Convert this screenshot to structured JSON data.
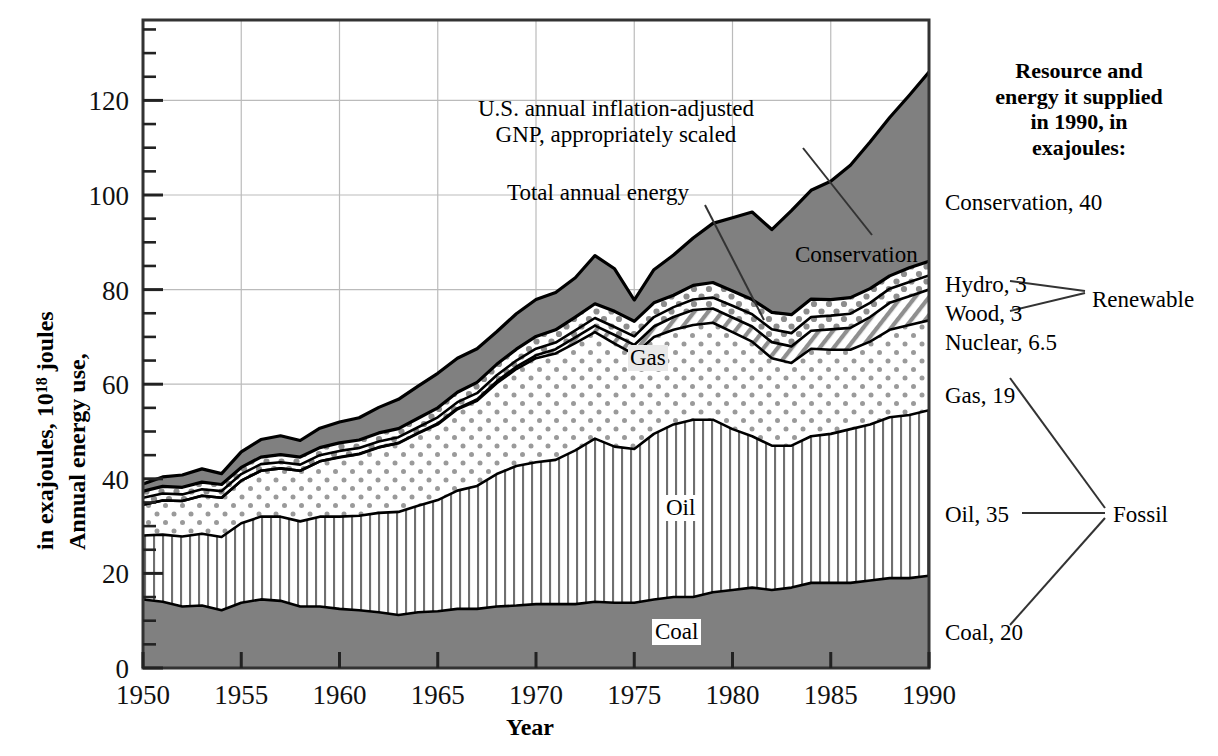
{
  "axes": {
    "x_title": "Year",
    "y_title_line1": "Annual energy use,",
    "y_title_line2_a": "in exajoules, 10",
    "y_title_line2_sup": "18",
    "y_title_line2_b": " joules",
    "x_ticks": [
      "1950",
      "1955",
      "1960",
      "1965",
      "1970",
      "1975",
      "1980",
      "1985",
      "1990"
    ],
    "y_ticks": [
      "0",
      "20",
      "40",
      "60",
      "80",
      "100",
      "120"
    ]
  },
  "annotations": {
    "gnp_line1": "U.S. annual inflation-adjusted",
    "gnp_line2": "GNP, appropriately scaled",
    "total_energy": "Total annual energy",
    "conservation_inline": "Conservation",
    "gas_inline": "Gas",
    "oil_inline": "Oil",
    "coal_inline": "Coal"
  },
  "legend": {
    "heading_line1": "Resource and",
    "heading_line2": "energy it supplied",
    "heading_line3": "in 1990, in",
    "heading_line4": "exajoules:",
    "items": [
      {
        "label": "Conservation, 40"
      },
      {
        "label": "Hydro, 3"
      },
      {
        "label": "Wood, 3"
      },
      {
        "label": "Nuclear, 6.5"
      },
      {
        "label": "Gas, 19"
      },
      {
        "label": "Oil, 35"
      },
      {
        "label": "Coal, 20"
      }
    ],
    "group_renewable": "Renewable",
    "group_fossil": "Fossil"
  },
  "chart_data": {
    "type": "area",
    "title": "",
    "xlabel": "Year",
    "ylabel": "Annual energy use, in exajoules, 10^18 joules",
    "xlim": [
      1950,
      1990
    ],
    "ylim": [
      0,
      137
    ],
    "grid": true,
    "stacked": true,
    "legend_position": "right",
    "x": [
      1950,
      1951,
      1952,
      1953,
      1954,
      1955,
      1956,
      1957,
      1958,
      1959,
      1960,
      1961,
      1962,
      1963,
      1964,
      1965,
      1966,
      1967,
      1968,
      1969,
      1970,
      1971,
      1972,
      1973,
      1974,
      1975,
      1976,
      1977,
      1978,
      1979,
      1980,
      1981,
      1982,
      1983,
      1984,
      1985,
      1986,
      1987,
      1988,
      1989,
      1990
    ],
    "series": [
      {
        "name": "Coal",
        "pattern": "solid-gray",
        "values": [
          14.5,
          14.0,
          13.0,
          13.2,
          12.2,
          13.8,
          14.5,
          14.2,
          13.0,
          13.0,
          12.5,
          12.2,
          11.8,
          11.2,
          11.8,
          12.0,
          12.5,
          12.5,
          13.0,
          13.2,
          13.5,
          13.5,
          13.5,
          14.0,
          13.8,
          13.8,
          14.5,
          15.0,
          15.0,
          16.0,
          16.5,
          17.0,
          16.5,
          17.0,
          18.0,
          18.0,
          18.0,
          18.5,
          19.0,
          19.0,
          19.5
        ]
      },
      {
        "name": "Oil",
        "pattern": "vertical-stripe",
        "values": [
          13.5,
          14.2,
          14.8,
          15.2,
          15.5,
          16.8,
          17.5,
          17.8,
          18.0,
          19.0,
          19.5,
          20.0,
          21.0,
          21.8,
          22.5,
          23.5,
          25.0,
          26.0,
          28.0,
          29.5,
          30.0,
          30.5,
          32.5,
          34.5,
          33.0,
          32.5,
          35.0,
          36.5,
          37.5,
          36.5,
          34.0,
          32.0,
          30.5,
          30.0,
          31.0,
          31.5,
          32.5,
          33.0,
          34.0,
          34.5,
          35.0
        ]
      },
      {
        "name": "Gas",
        "pattern": "fine-dot",
        "values": [
          6.5,
          7.2,
          7.5,
          8.0,
          8.3,
          9.0,
          9.7,
          10.2,
          10.7,
          11.7,
          12.5,
          13.0,
          13.8,
          14.5,
          15.3,
          16.0,
          17.2,
          18.0,
          19.2,
          20.5,
          22.0,
          22.5,
          22.7,
          22.5,
          21.8,
          20.0,
          20.5,
          20.0,
          20.0,
          20.5,
          20.5,
          20.0,
          18.5,
          17.5,
          18.5,
          17.8,
          16.8,
          17.5,
          18.5,
          19.0,
          19.0
        ]
      },
      {
        "name": "Nuclear",
        "pattern": "diagonal-hatch",
        "values": [
          0,
          0,
          0,
          0,
          0,
          0,
          0,
          0,
          0,
          0,
          0.1,
          0.1,
          0.1,
          0.1,
          0.1,
          0.2,
          0.2,
          0.3,
          0.4,
          0.5,
          0.6,
          0.9,
          1.2,
          1.4,
          1.8,
          2.0,
          2.2,
          2.7,
          3.2,
          3.0,
          3.1,
          3.2,
          3.4,
          3.5,
          3.8,
          4.3,
          4.6,
          5.2,
          5.7,
          6.1,
          6.5
        ]
      },
      {
        "name": "Wood",
        "pattern": "coarse-dot",
        "values": [
          1.5,
          1.5,
          1.4,
          1.4,
          1.4,
          1.4,
          1.4,
          1.3,
          1.3,
          1.3,
          1.3,
          1.2,
          1.2,
          1.2,
          1.2,
          1.3,
          1.3,
          1.3,
          1.3,
          1.3,
          1.4,
          1.4,
          1.5,
          1.6,
          1.7,
          1.8,
          2.0,
          2.1,
          2.2,
          2.3,
          2.5,
          2.6,
          2.7,
          2.8,
          2.9,
          2.9,
          3.0,
          3.0,
          3.0,
          3.0,
          3.0
        ]
      },
      {
        "name": "Hydro",
        "pattern": "coarse-dot",
        "values": [
          1.4,
          1.5,
          1.5,
          1.5,
          1.4,
          1.4,
          1.5,
          1.6,
          1.6,
          1.6,
          1.7,
          1.7,
          1.8,
          1.8,
          1.9,
          2.0,
          2.1,
          2.3,
          2.3,
          2.4,
          2.6,
          2.7,
          2.8,
          3.0,
          3.3,
          3.2,
          3.0,
          2.5,
          3.0,
          3.2,
          3.1,
          3.1,
          3.6,
          3.9,
          3.8,
          3.4,
          3.4,
          3.0,
          2.7,
          3.0,
          3.0
        ]
      },
      {
        "name": "Conservation",
        "pattern": "solid-gray",
        "values": [
          1.5,
          2.0,
          2.6,
          2.8,
          2.3,
          3.3,
          3.7,
          4.0,
          3.5,
          4.1,
          4.4,
          4.7,
          5.4,
          6.2,
          6.8,
          7.3,
          7.2,
          7.1,
          6.9,
          7.5,
          7.8,
          7.9,
          8.3,
          10.2,
          9.0,
          4.5,
          7.0,
          8.5,
          10.0,
          12.5,
          15.5,
          18.5,
          17.5,
          22.0,
          23.0,
          25.0,
          28.0,
          31.0,
          33.5,
          36.5,
          40.0
        ]
      }
    ],
    "total_line_name": "Total annual energy",
    "gnp_line_name": "U.S. annual inflation-adjusted GNP, appropriately scaled",
    "totals_1990": {
      "energy": 83.5,
      "gnp": 123.5
    }
  },
  "colors": {
    "gray_fill": "#808080",
    "line": "#000000",
    "grid": "#bbbbbb",
    "background": "#ffffff"
  }
}
